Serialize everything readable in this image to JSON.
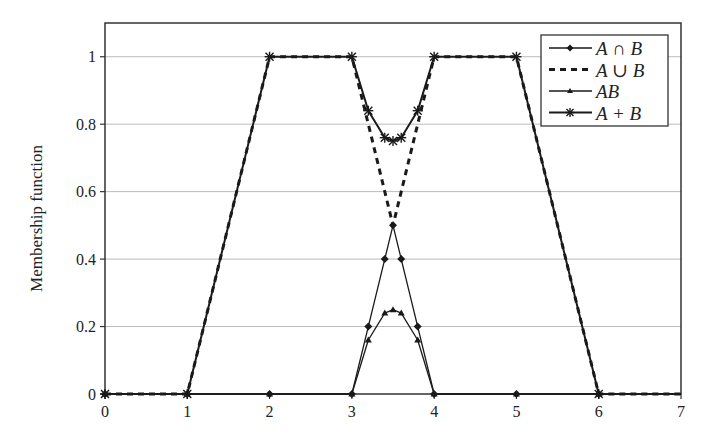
{
  "chart_data": {
    "type": "line",
    "title": "",
    "xlabel": "",
    "ylabel": "Membership function",
    "xlim": [
      0,
      7
    ],
    "ylim": [
      0,
      1.1
    ],
    "x_ticks": [
      0,
      1,
      2,
      3,
      4,
      5,
      6,
      7
    ],
    "x_tick_labels": [
      "0",
      "1",
      "2",
      "3",
      "4",
      "5",
      "6",
      "7"
    ],
    "y_ticks": [
      0,
      0.2,
      0.4,
      0.6,
      0.8,
      1
    ],
    "y_tick_labels": [
      "0",
      "0.2",
      "0.4",
      "0.6",
      "0.8",
      "1"
    ],
    "grid": "horizontal",
    "legend_position": "upper right",
    "series": [
      {
        "name": "A ∩ B",
        "style": "solid",
        "marker": "diamond",
        "x": [
          0,
          1,
          2,
          3,
          3.2,
          3.4,
          3.5,
          3.6,
          3.8,
          4,
          5,
          6,
          7
        ],
        "y": [
          0,
          0,
          0,
          0,
          0.2,
          0.4,
          0.5,
          0.4,
          0.2,
          0,
          0,
          0,
          0
        ]
      },
      {
        "name": "A ∪ B",
        "style": "dashed",
        "marker": "none",
        "x": [
          0,
          1,
          2,
          3,
          3.2,
          3.4,
          3.5,
          3.6,
          3.8,
          4,
          5,
          6,
          7
        ],
        "y": [
          0,
          0,
          1,
          1,
          0.8,
          0.6,
          0.5,
          0.6,
          0.8,
          1,
          1,
          0,
          0
        ]
      },
      {
        "name": "AB",
        "style": "solid",
        "marker": "triangle",
        "x": [
          0,
          1,
          2,
          3,
          3.2,
          3.4,
          3.5,
          3.6,
          3.8,
          4,
          5,
          6,
          7
        ],
        "y": [
          0,
          0,
          0,
          0,
          0.16,
          0.24,
          0.25,
          0.24,
          0.16,
          0,
          0,
          0,
          0
        ]
      },
      {
        "name": "A + B",
        "style": "solid-thick",
        "marker": "star",
        "x": [
          0,
          1,
          2,
          3,
          3.2,
          3.4,
          3.5,
          3.6,
          3.8,
          4,
          5,
          6,
          7
        ],
        "y": [
          0,
          0,
          1,
          1,
          0.84,
          0.76,
          0.75,
          0.76,
          0.84,
          1,
          1,
          0,
          0
        ]
      }
    ]
  },
  "legend": {
    "items": [
      {
        "label": "A ∩ B"
      },
      {
        "label": "A ∪ B"
      },
      {
        "label": "AB"
      },
      {
        "label": "A + B"
      }
    ]
  },
  "colors": {
    "line": "#1a1a1a",
    "grid": "#bbbbbb",
    "axis": "#333333"
  }
}
